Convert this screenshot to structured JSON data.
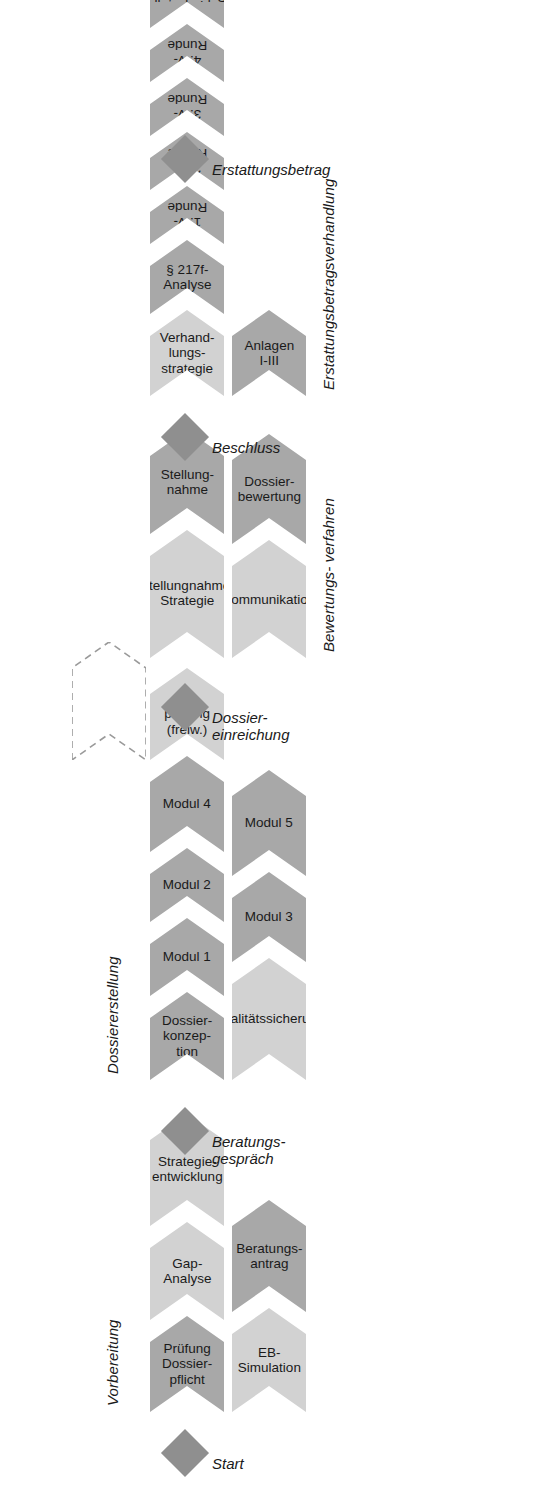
{
  "diagram": {
    "orientation": "rotated-90",
    "colors": {
      "light": "#d2d2d2",
      "dark": "#a8a8a8",
      "milestone": "#8f8f8f",
      "text": "#1a1a1a",
      "background": "#ffffff"
    }
  },
  "milestones": [
    {
      "id": "start",
      "label": "Start",
      "icon": "diamond-milestone-icon"
    },
    {
      "id": "beratungsgespraech",
      "label": "Beratungs-\ngespräch",
      "icon": "diamond-milestone-icon"
    },
    {
      "id": "dossiereinreichung",
      "label": "Dossier-\neinreichung",
      "icon": "diamond-milestone-icon"
    },
    {
      "id": "beschluss",
      "label": "Beschluss",
      "icon": "diamond-milestone-icon"
    },
    {
      "id": "erstattungsbetrag",
      "label": "Erstattungsbetrag",
      "icon": "diamond-milestone-icon"
    }
  ],
  "phases": [
    {
      "id": "vorbereitung",
      "label": "Vorbereitung",
      "rows": [
        [
          {
            "label": "Prüfung\nDossier-\npflicht",
            "tone": "dark"
          },
          {
            "label": "Gap-\nAnalyse",
            "tone": "light"
          },
          {
            "label": "Strategie-\nentwicklung",
            "tone": "light"
          }
        ],
        [
          {
            "label": "EB-\nSimulation",
            "tone": "light"
          },
          {
            "label": "Beratungs-\nantrag",
            "tone": "dark"
          }
        ]
      ]
    },
    {
      "id": "dossiererstellung",
      "label": "Dossiererstellung",
      "rows": [
        [
          {
            "label": "Dossier-\nkonzep-\ntion",
            "tone": "dark"
          },
          {
            "label": "Modul 1",
            "tone": "dark"
          },
          {
            "label": "Modul 2",
            "tone": "dark"
          },
          {
            "label": "Modul 4",
            "tone": "dark"
          },
          {
            "label": "Vor-\nprüfung\n(freiw.)",
            "tone": "light"
          }
        ],
        [
          {
            "label": "Qualitätssicherung",
            "tone": "light"
          },
          {
            "label": "Modul 3",
            "tone": "dark"
          },
          {
            "label": "Modul 5",
            "tone": "dark"
          }
        ]
      ],
      "optional_placeholder": {
        "style": "dashed-chevron",
        "label": ""
      }
    },
    {
      "id": "bewertungsverfahren",
      "label": "Bewertungs-\nverfahren",
      "rows": [
        [
          {
            "label": "Stellungnahme-\nStrategie",
            "tone": "light"
          },
          {
            "label": "Stellung-\nnahme",
            "tone": "dark"
          }
        ],
        [
          {
            "label": "Kommunikation",
            "tone": "light"
          },
          {
            "label": "Dossier-\nbewertung",
            "tone": "dark"
          }
        ]
      ]
    },
    {
      "id": "erstattungsbetragsverhandlung",
      "label": "Erstattungsbetragsverhandlung",
      "rows": [
        [
          {
            "label": "Verhand-\nlungs-\nstrategie",
            "tone": "light"
          },
          {
            "label": "§ 217f-\nAnalyse",
            "tone": "dark"
          },
          {
            "label": "1. V-Runde",
            "tone": "dark",
            "flip": true
          },
          {
            "label": "2. V-Runde",
            "tone": "dark",
            "flip": true
          },
          {
            "label": "3. V-Runde",
            "tone": "dark",
            "flip": true
          },
          {
            "label": "4. V-Runde",
            "tone": "dark",
            "flip": true
          },
          {
            "label": "Schiedsstelle",
            "tone": "dark",
            "flip": true
          },
          {
            "label": "Klage",
            "tone": "dark",
            "flip": true
          }
        ],
        [
          {
            "label": "Anlagen\nI-III",
            "tone": "dark"
          }
        ]
      ]
    }
  ]
}
